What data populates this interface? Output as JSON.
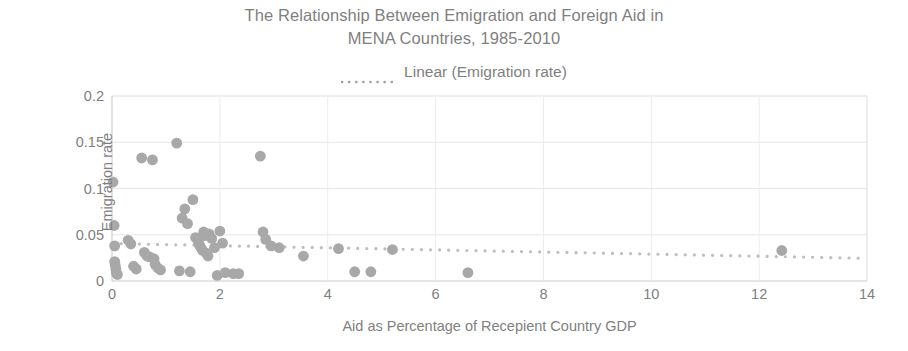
{
  "title": {
    "line1": "The Relationship Between Emigration and Foreign Aid in",
    "line2": "MENA Countries, 1985-2010"
  },
  "legend": {
    "label": "Linear (Emigration rate)",
    "marker": "dotted-line-icon"
  },
  "axes": {
    "x_label": "Aid as Percentage of Recepient Country GDP",
    "y_label": "Emigration rate",
    "x_ticks": [
      "0",
      "2",
      "4",
      "6",
      "8",
      "10",
      "12",
      "14"
    ],
    "y_ticks": [
      "0.2",
      "0.15",
      "0.1",
      "0.05",
      "0"
    ]
  },
  "colors": {
    "marker": "#a8a8a8",
    "text": "#7f7f7f",
    "grid": "#e4e4e4",
    "frame": "#d9d9d9",
    "trendline": "#bfbfbf"
  },
  "chart_data": {
    "type": "scatter",
    "title": "The Relationship Between Emigration and Foreign Aid in MENA Countries, 1985-2010",
    "xlabel": "Aid as Percentage of Recepient Country GDP",
    "ylabel": "Emigration rate",
    "xlim": [
      0,
      14
    ],
    "ylim": [
      0,
      0.2
    ],
    "xticks": [
      0,
      2,
      4,
      6,
      8,
      10,
      12,
      14
    ],
    "yticks": [
      0,
      0.05,
      0.1,
      0.15,
      0.2
    ],
    "grid": true,
    "legend": [
      "Linear (Emigration rate)"
    ],
    "legend_position": "top",
    "series": [
      {
        "name": "Emigration rate",
        "marker": "circle",
        "points": [
          [
            0.02,
            0.107
          ],
          [
            0.04,
            0.06
          ],
          [
            0.05,
            0.038
          ],
          [
            0.05,
            0.021
          ],
          [
            0.06,
            0.017
          ],
          [
            0.07,
            0.013
          ],
          [
            0.08,
            0.009
          ],
          [
            0.1,
            0.007
          ],
          [
            0.3,
            0.044
          ],
          [
            0.35,
            0.04
          ],
          [
            0.4,
            0.016
          ],
          [
            0.45,
            0.013
          ],
          [
            0.55,
            0.133
          ],
          [
            0.6,
            0.031
          ],
          [
            0.65,
            0.027
          ],
          [
            0.7,
            0.026
          ],
          [
            0.75,
            0.131
          ],
          [
            0.78,
            0.024
          ],
          [
            0.8,
            0.018
          ],
          [
            0.85,
            0.014
          ],
          [
            0.9,
            0.012
          ],
          [
            1.2,
            0.149
          ],
          [
            1.25,
            0.011
          ],
          [
            1.3,
            0.068
          ],
          [
            1.35,
            0.078
          ],
          [
            1.4,
            0.062
          ],
          [
            1.45,
            0.01
          ],
          [
            1.5,
            0.088
          ],
          [
            1.55,
            0.047
          ],
          [
            1.6,
            0.043
          ],
          [
            1.62,
            0.039
          ],
          [
            1.65,
            0.036
          ],
          [
            1.68,
            0.033
          ],
          [
            1.7,
            0.053
          ],
          [
            1.72,
            0.049
          ],
          [
            1.75,
            0.03
          ],
          [
            1.78,
            0.027
          ],
          [
            1.8,
            0.051
          ],
          [
            1.85,
            0.046
          ],
          [
            1.9,
            0.036
          ],
          [
            1.95,
            0.006
          ],
          [
            2.0,
            0.054
          ],
          [
            2.05,
            0.041
          ],
          [
            2.1,
            0.009
          ],
          [
            2.25,
            0.008
          ],
          [
            2.35,
            0.008
          ],
          [
            2.75,
            0.135
          ],
          [
            2.8,
            0.053
          ],
          [
            2.85,
            0.045
          ],
          [
            2.95,
            0.038
          ],
          [
            3.1,
            0.036
          ],
          [
            3.55,
            0.027
          ],
          [
            4.2,
            0.035
          ],
          [
            4.5,
            0.01
          ],
          [
            4.8,
            0.01
          ],
          [
            5.2,
            0.034
          ],
          [
            6.6,
            0.009
          ],
          [
            12.42,
            0.033
          ]
        ]
      }
    ],
    "trendline": {
      "name": "Linear (Emigration rate)",
      "style": "dotted",
      "x": [
        0.0,
        14.0
      ],
      "y": [
        0.0405,
        0.0245
      ]
    }
  }
}
